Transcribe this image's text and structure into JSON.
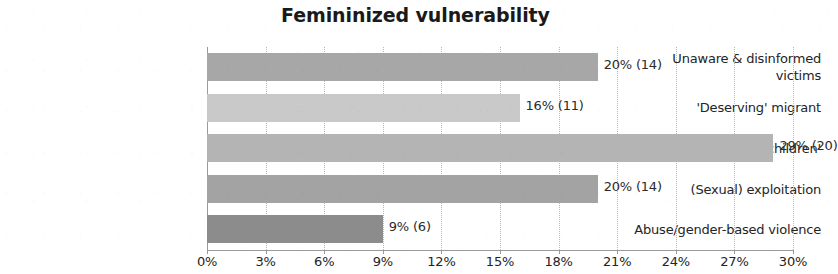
{
  "chart_data": {
    "type": "bar",
    "orientation": "horizontal",
    "title": "Femininized vulnerability",
    "xlabel": "",
    "ylabel": "",
    "xlim": [
      0,
      30
    ],
    "grid": true,
    "legend": false,
    "x_tick_labels": [
      "0%",
      "3%",
      "6%",
      "9%",
      "12%",
      "15%",
      "18%",
      "21%",
      "24%",
      "27%",
      "30%"
    ],
    "x_tick_values": [
      0,
      3,
      6,
      9,
      12,
      15,
      18,
      21,
      24,
      27,
      30
    ],
    "categories": [
      "Unaware & disinformed victims",
      "'Deserving' migrant",
      "'Womenandchildren'",
      "(Sexual) exploitation",
      "Abuse/gender-based violence"
    ],
    "values": [
      20,
      16,
      29,
      20,
      9
    ],
    "counts": [
      14,
      11,
      20,
      14,
      6
    ],
    "data_labels": [
      "20% (14)",
      "16% (11)",
      "29% (20)",
      "20% (14)",
      "9% (6)"
    ],
    "bar_colors": [
      "#a7a7a7",
      "#c9c9c9",
      "#b4b4b4",
      "#a3a3a3",
      "#8c8c8c"
    ]
  },
  "bars": [
    {
      "category_line1": "Unaware & disinformed",
      "category_line2": "victims",
      "label": "20% (14)",
      "value": 20,
      "count": 14,
      "color": "#a7a7a7"
    },
    {
      "category_line1": "'Deserving' migrant",
      "category_line2": "",
      "label": "16% (11)",
      "value": 16,
      "count": 11,
      "color": "#c9c9c9"
    },
    {
      "category_line1": "'Womenandchildren'",
      "category_line2": "",
      "label": "29% (20)",
      "value": 29,
      "count": 20,
      "color": "#b4b4b4"
    },
    {
      "category_line1": "(Sexual) exploitation",
      "category_line2": "",
      "label": "20% (14)",
      "value": 20,
      "count": 14,
      "color": "#a3a3a3"
    },
    {
      "category_line1": "Abuse/gender-based violence",
      "category_line2": "",
      "label": "9% (6)",
      "value": 9,
      "count": 6,
      "color": "#8c8c8c"
    }
  ],
  "ticks": [
    {
      "label": "0%",
      "value": 0
    },
    {
      "label": "3%",
      "value": 3
    },
    {
      "label": "6%",
      "value": 6
    },
    {
      "label": "9%",
      "value": 9
    },
    {
      "label": "12%",
      "value": 12
    },
    {
      "label": "15%",
      "value": 15
    },
    {
      "label": "18%",
      "value": 18
    },
    {
      "label": "21%",
      "value": 21
    },
    {
      "label": "24%",
      "value": 24
    },
    {
      "label": "27%",
      "value": 27
    },
    {
      "label": "30%",
      "value": 30
    }
  ]
}
